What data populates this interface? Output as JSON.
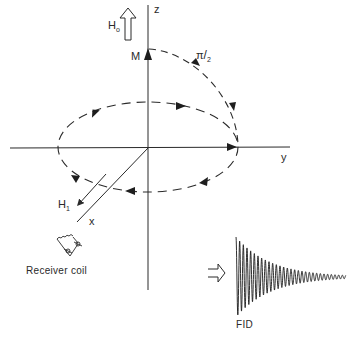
{
  "figure": {
    "axes": {
      "z_label": "z",
      "y_label": "y",
      "x_label": "x"
    },
    "vectors": {
      "static_field": {
        "symbol": "H",
        "subscript": "o"
      },
      "rf_field": {
        "symbol": "H",
        "subscript": "1"
      },
      "magnetization": {
        "symbol": "M"
      }
    },
    "pulse_label": {
      "numerator": "π",
      "denominator": "2"
    },
    "receiver_label": "Receiver coil",
    "signal_label": "FID",
    "colors": {
      "ink": "#2a2a2a",
      "background": "#ffffff"
    }
  }
}
